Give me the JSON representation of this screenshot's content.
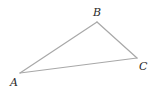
{
  "diagram": {
    "type": "triangle",
    "stroke_color": "#a8a8a8",
    "label_color": "#2a2a2a",
    "vertices": [
      {
        "name": "A",
        "x": 20,
        "y": 73,
        "label": "A",
        "label_x": 10,
        "label_y": 86
      },
      {
        "name": "B",
        "x": 97,
        "y": 22,
        "label": "B",
        "label_x": 93,
        "label_y": 16
      },
      {
        "name": "C",
        "x": 137,
        "y": 58,
        "label": "C",
        "label_x": 139,
        "label_y": 70
      }
    ],
    "edges": [
      {
        "from": "A",
        "to": "B"
      },
      {
        "from": "B",
        "to": "C"
      },
      {
        "from": "C",
        "to": "A"
      }
    ]
  }
}
